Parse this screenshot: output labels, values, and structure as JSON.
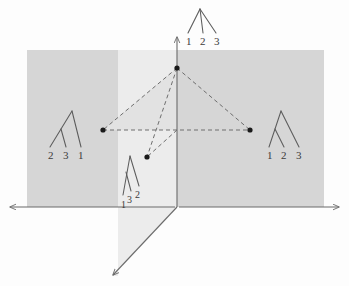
{
  "figure": {
    "type": "geometric-diagram",
    "background_color": "#fdfdfd"
  },
  "colors": {
    "plane_horizontal": "#d6d6d6",
    "plane_vertical": "#ececec",
    "wedge": "#e2e2e2",
    "axis": "#6b6b6b",
    "dashed": "#6e6e6e",
    "point": "#1a1a1a",
    "tree_stroke": "#5c5c5c",
    "text": "#3b3b3b"
  },
  "axes": {
    "horizontal": {
      "name": "horizontal-axis",
      "x1": 10,
      "y1": 207,
      "x2": 339,
      "y2": 207
    },
    "vertical": {
      "name": "vertical-axis",
      "x1": 177,
      "y1": 36,
      "x2": 177,
      "y2": 207
    },
    "diagonal": {
      "name": "diagonal-axis",
      "x1": 177,
      "y1": 207,
      "x2": 112,
      "y2": 276
    }
  },
  "planes": {
    "horizontal_quad": "27,50 324,50 324,207 27,207",
    "vertical_quad": "118,50 177,50 177,207 112,276 118,276",
    "wedge_tri": "177,68 103,130 177,130"
  },
  "points": [
    {
      "name": "apex-point",
      "x": 177,
      "y": 68
    },
    {
      "name": "left-point",
      "x": 103,
      "y": 130
    },
    {
      "name": "right-point",
      "x": 250,
      "y": 130
    },
    {
      "name": "lower-point",
      "x": 147,
      "y": 157
    }
  ],
  "dashed_segments": [
    {
      "name": "apex-to-left",
      "x1": 177,
      "y1": 68,
      "x2": 103,
      "y2": 130
    },
    {
      "name": "apex-to-right",
      "x1": 177,
      "y1": 68,
      "x2": 250,
      "y2": 130
    },
    {
      "name": "apex-to-lower",
      "x1": 177,
      "y1": 68,
      "x2": 147,
      "y2": 157
    },
    {
      "name": "left-to-right",
      "x1": 103,
      "y1": 130,
      "x2": 250,
      "y2": 130
    },
    {
      "name": "origin-to-lower",
      "x1": 177,
      "y1": 130,
      "x2": 147,
      "y2": 157
    }
  ],
  "trees": [
    {
      "id": "top-tree",
      "shape": "star",
      "leaf_labels": [
        "1",
        "2",
        "3"
      ],
      "label_positions": [
        {
          "text": "1",
          "x": 186,
          "y": 36
        },
        {
          "text": "2",
          "x": 200,
          "y": 36
        },
        {
          "text": "3",
          "x": 214,
          "y": 36
        }
      ],
      "edges": [
        {
          "x1": 200,
          "y1": 9,
          "x2": 188,
          "y2": 33
        },
        {
          "x1": 200,
          "y1": 9,
          "x2": 203,
          "y2": 33
        },
        {
          "x1": 200,
          "y1": 9,
          "x2": 216,
          "y2": 33
        }
      ]
    },
    {
      "id": "left-tree",
      "shape": "cherry-23",
      "leaf_labels": [
        "2",
        "3",
        "1"
      ],
      "label_positions": [
        {
          "text": "2",
          "x": 48,
          "y": 150
        },
        {
          "text": "3",
          "x": 63,
          "y": 150
        },
        {
          "text": "1",
          "x": 78,
          "y": 150
        }
      ],
      "edges": [
        {
          "x1": 72,
          "y1": 111,
          "x2": 50,
          "y2": 147
        },
        {
          "x1": 72,
          "y1": 111,
          "x2": 81,
          "y2": 147
        },
        {
          "x1": 61,
          "y1": 129,
          "x2": 66,
          "y2": 147
        }
      ]
    },
    {
      "id": "right-tree",
      "shape": "cherry-12",
      "leaf_labels": [
        "1",
        "2",
        "3"
      ],
      "label_positions": [
        {
          "text": "1",
          "x": 267,
          "y": 150
        },
        {
          "text": "2",
          "x": 281,
          "y": 150
        },
        {
          "text": "3",
          "x": 296,
          "y": 150
        }
      ],
      "edges": [
        {
          "x1": 281,
          "y1": 111,
          "x2": 269,
          "y2": 147
        },
        {
          "x1": 281,
          "y1": 111,
          "x2": 299,
          "y2": 147
        },
        {
          "x1": 275,
          "y1": 129,
          "x2": 284,
          "y2": 147
        }
      ]
    },
    {
      "id": "bottom-tree",
      "shape": "cherry-13-skew",
      "leaf_labels": [
        "1",
        "3",
        "2"
      ],
      "label_positions": [
        {
          "text": "1",
          "x": 121,
          "y": 199
        },
        {
          "text": "3",
          "x": 127,
          "y": 194
        },
        {
          "text": "2",
          "x": 135,
          "y": 189
        }
      ],
      "edges": [
        {
          "x1": 130,
          "y1": 156,
          "x2": 123,
          "y2": 195
        },
        {
          "x1": 130,
          "y1": 156,
          "x2": 139,
          "y2": 186
        },
        {
          "x1": 126,
          "y1": 172,
          "x2": 131,
          "y2": 191
        }
      ]
    }
  ]
}
